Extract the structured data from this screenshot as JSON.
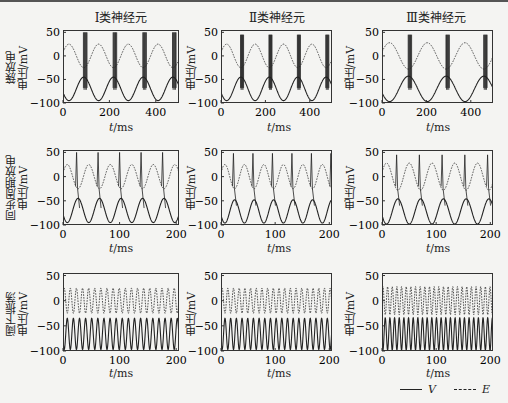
{
  "column_titles": [
    "Ⅰ类神经元",
    "Ⅱ类神经元",
    "Ⅲ类神经元"
  ],
  "row_labels": [
    {
      "line1": "簇放电",
      "line2": "电压/mV"
    },
    {
      "line1": "同步周期放电",
      "line2": "电压/mV"
    },
    {
      "line1": "阈下振荡",
      "line2": "电压/mV"
    }
  ],
  "inner_ylabel": "电压/mV",
  "xlabel": {
    "var": "t",
    "unit": "/ms"
  },
  "legend": [
    {
      "label": "V",
      "style": "solid"
    },
    {
      "label": "E",
      "style": "dashed"
    }
  ],
  "chart_data": [
    {
      "type": "line",
      "row": "簇放电",
      "col": "Ⅰ类神经元",
      "ylabel": "电压/mV",
      "xlabel": "t/ms",
      "xlim": [
        0,
        500
      ],
      "ylim": [
        -100,
        55
      ],
      "xticks": [
        0,
        200,
        400
      ],
      "yticks": [
        50,
        0,
        -50,
        -100
      ],
      "E": {
        "amp": 25,
        "period": 128,
        "phase": 0
      },
      "V": {
        "base": -70,
        "amp": 25,
        "bursts_at": [
          88,
          216,
          344,
          472
        ],
        "burst_width": 18,
        "spike_peak": 50,
        "spike_trough": -68
      }
    },
    {
      "type": "line",
      "row": "簇放电",
      "col": "Ⅱ类神经元",
      "ylabel": "电压/mV",
      "xlabel": "t/ms",
      "xlim": [
        0,
        500
      ],
      "ylim": [
        -100,
        55
      ],
      "xticks": [
        0,
        200,
        400
      ],
      "yticks": [
        50,
        0,
        -50,
        -100
      ],
      "E": {
        "amp": 25,
        "period": 128,
        "phase": 0
      },
      "V": {
        "base": -70,
        "amp": 25,
        "bursts_at": [
          88,
          216,
          344,
          472
        ],
        "burst_width": 16,
        "spike_peak": 45,
        "spike_trough": -68
      }
    },
    {
      "type": "line",
      "row": "簇放电",
      "col": "Ⅲ类神经元",
      "ylabel": "电压/mV",
      "xlabel": "t/ms",
      "xlim": [
        0,
        500
      ],
      "ylim": [
        -100,
        55
      ],
      "xticks": [
        0,
        200,
        400
      ],
      "yticks": [
        50,
        0,
        -50,
        -100
      ],
      "E": {
        "amp": 28,
        "period": 170,
        "phase": 0
      },
      "V": {
        "base": -70,
        "amp": 27,
        "bursts_at": [
          118,
          288,
          458
        ],
        "burst_width": 18,
        "spike_peak": 45,
        "spike_trough": -68
      }
    },
    {
      "type": "line",
      "row": "同步周期放电",
      "col": "Ⅰ类神经元",
      "ylabel": "电压/mV",
      "xlabel": "t/ms",
      "xlim": [
        0,
        205
      ],
      "ylim": [
        -100,
        55
      ],
      "xticks": [
        0,
        100,
        200
      ],
      "yticks": [
        50,
        0,
        -50,
        -100
      ],
      "E": {
        "amp": 25,
        "period": 38,
        "phase": 0
      },
      "V": {
        "base": -70,
        "amp": 25,
        "spikes_at": [
          24,
          62,
          100,
          138,
          176
        ],
        "spike_peak": 50,
        "after": -65
      }
    },
    {
      "type": "line",
      "row": "同步周期放电",
      "col": "Ⅱ类神经元",
      "ylabel": "电压/mV",
      "xlabel": "t/ms",
      "xlim": [
        0,
        205
      ],
      "ylim": [
        -100,
        55
      ],
      "xticks": [
        0,
        100,
        200
      ],
      "yticks": [
        50,
        0,
        -50,
        -100
      ],
      "E": {
        "amp": 25,
        "period": 36,
        "phase": 0
      },
      "V": {
        "base": -72,
        "amp": 24,
        "spikes_at": [
          23,
          59,
          95,
          131,
          167,
          203
        ],
        "spike_peak": 48,
        "after": -60
      }
    },
    {
      "type": "line",
      "row": "同步周期放电",
      "col": "Ⅲ类神经元",
      "ylabel": "电压/mV",
      "xlabel": "t/ms",
      "xlim": [
        0,
        205
      ],
      "ylim": [
        -100,
        55
      ],
      "xticks": [
        0,
        100,
        200
      ],
      "yticks": [
        50,
        0,
        -50,
        -100
      ],
      "E": {
        "amp": 28,
        "period": 42,
        "phase": 0
      },
      "V": {
        "base": -72,
        "amp": 26,
        "spikes_at": [
          27,
          69,
          111,
          153,
          195
        ],
        "spike_peak": 45,
        "after": -60
      }
    },
    {
      "type": "line",
      "row": "阈下振荡",
      "col": "Ⅰ类神经元",
      "ylabel": "电压/mV",
      "xlabel": "t/ms",
      "xlim": [
        0,
        205
      ],
      "ylim": [
        -100,
        55
      ],
      "xticks": [
        0,
        100,
        200
      ],
      "yticks": [
        50,
        0,
        -50,
        -100
      ],
      "E": {
        "amp": 25,
        "period": 10.8,
        "phase": 0
      },
      "V": {
        "base": -66,
        "amp": 31
      }
    },
    {
      "type": "line",
      "row": "阈下振荡",
      "col": "Ⅱ类神经元",
      "ylabel": "电压/mV",
      "xlabel": "t/ms",
      "xlim": [
        0,
        205
      ],
      "ylim": [
        -100,
        55
      ],
      "xticks": [
        0,
        100,
        200
      ],
      "yticks": [
        50,
        0,
        -50,
        -100
      ],
      "E": {
        "amp": 25,
        "period": 10.5,
        "phase": 0
      },
      "V": {
        "base": -66,
        "amp": 31
      }
    },
    {
      "type": "line",
      "row": "阈下振荡",
      "col": "Ⅲ类神经元",
      "ylabel": "电压/mV",
      "xlabel": "t/ms",
      "xlim": [
        0,
        205
      ],
      "ylim": [
        -100,
        55
      ],
      "xticks": [
        0,
        100,
        200
      ],
      "yticks": [
        50,
        0,
        -50,
        -100
      ],
      "E": {
        "amp": 28,
        "period": 8.6,
        "phase": 0
      },
      "V": {
        "base": -66,
        "amp": 32
      }
    }
  ]
}
